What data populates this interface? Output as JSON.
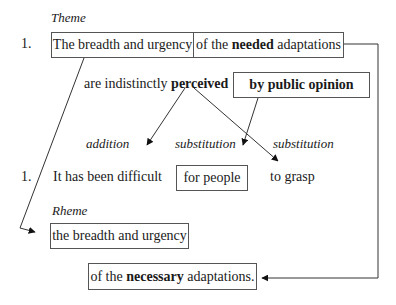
{
  "labels": {
    "theme": "Theme",
    "rheme": "Rheme",
    "addition": "addition",
    "substitution_1": "substitution",
    "substitution_2": "substitution"
  },
  "line1": {
    "number": "1.",
    "box_left": "The breadth and urgency",
    "box_right": {
      "pre": "of the ",
      "bold": "needed",
      "post": " adaptations"
    }
  },
  "line2": {
    "pre": "are indistinctly ",
    "bold": "perceived",
    "box": "by public opinion"
  },
  "line3": {
    "number": "1.",
    "text1": "It has been difficult",
    "box": "for people",
    "text2": "to grasp"
  },
  "rheme_box": "the breadth and urgency",
  "final_box": {
    "pre": "of the ",
    "bold": "necessary",
    "post": " adaptations."
  },
  "colors": {
    "line": "#333333",
    "box_border": "#555555",
    "text": "#1a1a1a"
  }
}
